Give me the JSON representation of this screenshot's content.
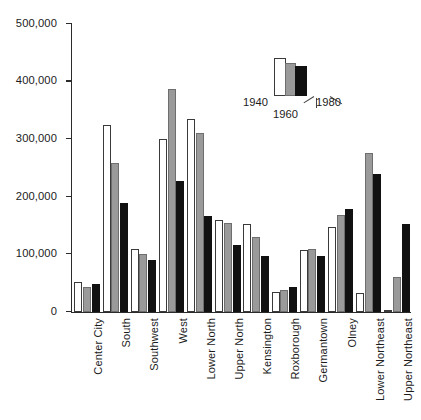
{
  "chart_data": {
    "type": "bar",
    "title": "",
    "subtitle": "",
    "xlabel": "",
    "ylabel": "",
    "ylim": [
      0,
      500000
    ],
    "ytick_labels": [
      "0",
      "100,000",
      "200,000",
      "300,000",
      "400,000",
      "500,000"
    ],
    "ytick_values": [
      0,
      100000,
      200000,
      300000,
      400000,
      500000
    ],
    "grid": false,
    "legend_position": "inside-top-right",
    "categories": [
      "Center City",
      "South",
      "Southwest",
      "West",
      "Lower North",
      "Upper North",
      "Kensington",
      "Roxborough",
      "Germantown",
      "Olney",
      "Lower Northeast",
      "Upper Northeast"
    ],
    "series": [
      {
        "name": "1940",
        "color": "#ffffff",
        "values": [
          52000,
          325000,
          110000,
          300000,
          335000,
          160000,
          152000,
          35000,
          107000,
          148000,
          33000,
          4000
        ]
      },
      {
        "name": "1960",
        "color": "#9a9a9a",
        "values": [
          44000,
          258000,
          100000,
          388000,
          310000,
          155000,
          131000,
          38000,
          110000,
          168000,
          276000,
          60000
        ]
      },
      {
        "name": "1980",
        "color": "#111111",
        "values": [
          48000,
          190000,
          90000,
          228000,
          167000,
          117000,
          97000,
          43000,
          97000,
          178000,
          240000,
          152000
        ]
      }
    ],
    "legend": {
      "entries": [
        "1940",
        "1960",
        "1980"
      ]
    }
  }
}
